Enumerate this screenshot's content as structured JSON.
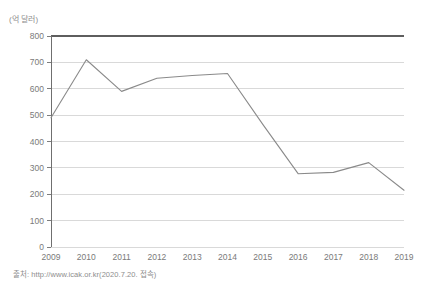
{
  "unit_label": "(억 달러)",
  "source_label": "출처: http://www.icak.or.kr(2020.7.20. 접속)",
  "colors": {
    "line": "#8a8a8a",
    "gridline": "#cfcfcf",
    "axis": "#6f6f6f",
    "top_border": "#5e5e5e",
    "text": "#7a7a7a",
    "muted_text": "#8d8d8d",
    "background": "#ffffff"
  },
  "chart_data": {
    "type": "line",
    "title": "",
    "subtitle": "",
    "xlabel": "",
    "ylabel": "(억 달러)",
    "categories": [
      "2009",
      "2010",
      "2011",
      "2012",
      "2013",
      "2014",
      "2015",
      "2016",
      "2017",
      "2018",
      "2019"
    ],
    "values": [
      490,
      710,
      590,
      640,
      650,
      658,
      465,
      278,
      283,
      320,
      215
    ],
    "series": [
      {
        "name": "수출액",
        "values": [
          490,
          710,
          590,
          640,
          650,
          658,
          465,
          278,
          283,
          320,
          215
        ]
      }
    ],
    "ylim": [
      0,
      800
    ],
    "ytick_values": [
      0,
      100,
      200,
      300,
      400,
      500,
      600,
      700,
      800
    ],
    "ytick_labels": [
      "0",
      "100",
      "200",
      "300",
      "400",
      "500",
      "600",
      "700",
      "800"
    ],
    "xtick_labels": [
      "2009",
      "2010",
      "2011",
      "2012",
      "2013",
      "2014",
      "2015",
      "2016",
      "2017",
      "2018",
      "2019"
    ],
    "grid": true,
    "grid_axis": "y",
    "legend": false,
    "legend_position": "none",
    "markers": false,
    "annotations": []
  }
}
